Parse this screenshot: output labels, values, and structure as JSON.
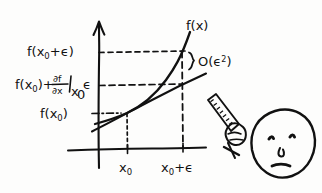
{
  "figure": {
    "background_color": "#fdfdfc",
    "ink_color": "#111111",
    "style": "hand-drawn"
  },
  "axis": {
    "y_axis_name": "vertical-axis",
    "x_axis_name": "horizontal-axis",
    "y_arrow": "arrow-up"
  },
  "y_labels": {
    "top": {
      "text": "f(x₀+ϵ)",
      "f": "f(",
      "x": "x",
      "sub": "0",
      "tail": "+ϵ)"
    },
    "middle": {
      "text": "f(x₀)+∂f/∂x|ₓ₀ ϵ",
      "part1_f": "f(",
      "part1_x": "x",
      "part1_sub": "0",
      "part1_close": ")+",
      "numerator": "∂f",
      "denominator": "∂x",
      "bar_at": "|",
      "eval_x": "x",
      "eval_sub": "0",
      "epsilon": "ϵ"
    },
    "bottom": {
      "text": "f(x₀)",
      "f": "f(",
      "x": "x",
      "sub": "0",
      "close": ")"
    }
  },
  "x_labels": {
    "left": {
      "text": "x₀",
      "x": "x",
      "sub": "0"
    },
    "right": {
      "text": "x₀+ϵ",
      "x": "x",
      "sub": "0",
      "tail": "+ϵ"
    }
  },
  "annotations": {
    "curve_label": {
      "text": "f(x)",
      "f": "f(",
      "x": "x",
      "close": ")"
    },
    "error_term": {
      "text": "O(ϵ²)",
      "head": "O(ϵ",
      "sup": "2",
      "close": ")"
    },
    "brace": "curly-brace"
  },
  "drawing": {
    "curve_name": "function-curve",
    "tangent_name": "tangent-line",
    "leader_top": "dashed-leader-top",
    "leader_middle": "dashed-leader-middle",
    "leader_bottom": "dashdot-leader-bottom",
    "vertical_x0": "dotted-vertical-x0",
    "vertical_x0e": "dashed-vertical-x0-eps"
  },
  "doodle": {
    "ruler_name": "ruler",
    "hand_name": "hand",
    "face_name": "face",
    "face_parts": [
      "left-eye",
      "right-eye",
      "nose",
      "mouth"
    ]
  }
}
